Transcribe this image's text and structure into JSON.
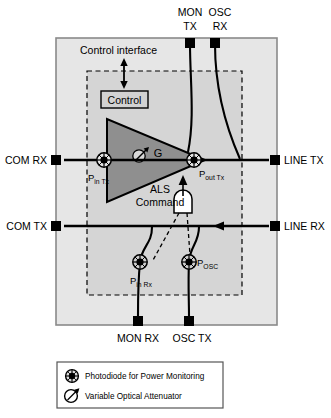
{
  "diagram": {
    "colors": {
      "background": "#ffffff",
      "outer_box_fill": "#e6e6e6",
      "inner_shade_fill": "#c9c9c9",
      "triangle_fill": "#8f8f8f",
      "stroke": "#000000",
      "terminal": "#000000",
      "control_box_fill": "#d2d2d2",
      "gate_fill": "#ffffff"
    },
    "ports": {
      "top": [
        {
          "name": "mon-tx",
          "line1": "MON",
          "line2": "TX",
          "x": 190
        },
        {
          "name": "osc-rx",
          "line1": "OSC",
          "line2": "RX",
          "x": 215
        }
      ],
      "bottom": [
        {
          "name": "mon-rx",
          "label": "MON RX",
          "x": 138
        },
        {
          "name": "osc-tx",
          "label": "OSC TX",
          "x": 190
        }
      ],
      "left": [
        {
          "name": "com-rx",
          "label": "COM RX",
          "y": 156
        },
        {
          "name": "com-tx",
          "label": "COM TX",
          "y": 222
        }
      ],
      "right": [
        {
          "name": "line-tx",
          "label": "LINE TX",
          "y": 156
        },
        {
          "name": "line-rx",
          "label": "LINE RX",
          "y": 222
        }
      ]
    },
    "blocks": {
      "control_interface_label": "Control interface",
      "control_box_label": "Control",
      "gain_label": "G",
      "als_line1": "ALS",
      "als_line2": "Command"
    },
    "monitors": [
      {
        "name": "p-in-tx",
        "main": "P",
        "sub": "in Tx",
        "cx": 104,
        "cy": 160
      },
      {
        "name": "p-out-tx",
        "main": "P",
        "sub": "out Tx",
        "cx": 194,
        "cy": 160
      },
      {
        "name": "p-in-rx",
        "main": "P",
        "sub": "in Rx",
        "cx": 148,
        "cy": 265
      },
      {
        "name": "p-osc",
        "main": "P",
        "sub": "OSC",
        "cx": 188,
        "cy": 262
      }
    ],
    "legend": {
      "items": [
        {
          "icon": "photodiode-icon",
          "label": "Photodiode for Power Monitoring"
        },
        {
          "icon": "variable-optical-attenuator-icon",
          "label": "Variable Optical Attenuator"
        }
      ]
    }
  }
}
